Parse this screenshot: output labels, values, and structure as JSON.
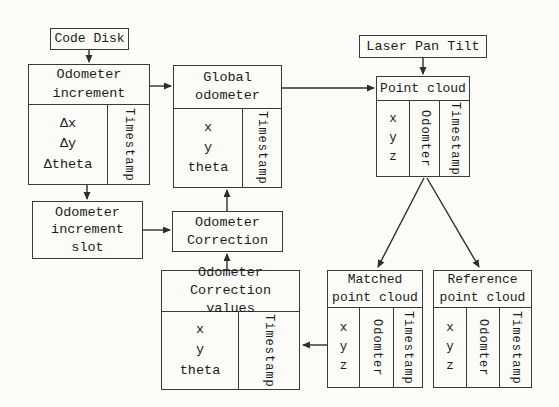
{
  "colors": {
    "background": "#fbfbf8",
    "line": "#2e2e2e",
    "border": "#3a3a3a",
    "text": "#1c1c1c"
  },
  "boxes": {
    "code_disk": {
      "label": "Code Disk"
    },
    "odometer_increment": {
      "title": "Odometer\nincrement",
      "fields": [
        "Δx",
        "Δy",
        "Δtheta"
      ],
      "timestamp_label": "Timestamp"
    },
    "global_odometer": {
      "title": "Global\nodometer",
      "fields": [
        "x",
        "y",
        "theta"
      ],
      "timestamp_label": "Timestamp"
    },
    "laser_pan_tilt": {
      "label": "Laser Pan Tilt"
    },
    "point_cloud": {
      "title": "Point cloud",
      "fields": [
        "x",
        "y",
        "z"
      ],
      "odometer_label": "Odomter",
      "timestamp_label": "Timestamp"
    },
    "odometer_increment_slot": {
      "label": "Odometer\nincrement\nslot"
    },
    "odometer_correction": {
      "label": "Odometer\nCorrection"
    },
    "odometer_correction_values": {
      "title": "Odometer\nCorrection values",
      "fields": [
        "x",
        "y",
        "theta"
      ],
      "timestamp_label": "Timestamp"
    },
    "matched_point_cloud": {
      "title": "Matched\npoint cloud",
      "fields": [
        "x",
        "y",
        "z"
      ],
      "odometer_label": "Odomter",
      "timestamp_label": "Timestamp"
    },
    "reference_point_cloud": {
      "title": "Reference\npoint cloud",
      "fields": [
        "x",
        "y",
        "z"
      ],
      "odometer_label": "Odomter",
      "timestamp_label": "Timestamp"
    }
  }
}
